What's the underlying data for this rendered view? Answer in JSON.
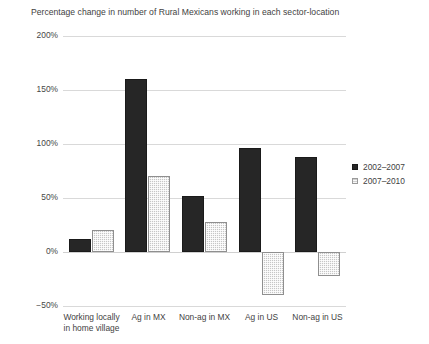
{
  "chart_data": {
    "type": "bar",
    "title": "Percentage change in number of Rural Mexicans working in each sector-location",
    "xlabel": "",
    "ylabel": "",
    "categories": [
      "Working locally in home village",
      "Ag in MX",
      "Non-ag in MX",
      "Ag in US",
      "Non-ag in US"
    ],
    "series": [
      {
        "name": "2002–2007",
        "values": [
          12,
          160,
          52,
          96,
          88
        ],
        "color": "#262626"
      },
      {
        "name": "2007–2010",
        "values": [
          20,
          70,
          28,
          -40,
          -22
        ],
        "color": "#c6c6c6"
      }
    ],
    "ylim": [
      -50,
      200
    ],
    "yticks": [
      -50,
      0,
      50,
      100,
      150,
      200
    ],
    "ytick_labels": [
      "−50%",
      "0%",
      "50%",
      "100%",
      "150%",
      "200%"
    ],
    "grid": true,
    "legend_position": "right"
  },
  "legend": {
    "items": [
      {
        "label": "2002–2007"
      },
      {
        "label": "2007–2010"
      }
    ]
  }
}
